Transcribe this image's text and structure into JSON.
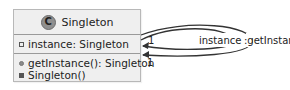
{
  "class": {
    "stereotype_glyph": "C",
    "name": "Singleton",
    "attributes": [
      {
        "visibility": "private",
        "text": "instance: Singleton"
      }
    ],
    "methods": [
      {
        "visibility": "public",
        "text": "getInstance(): Singleton"
      },
      {
        "visibility": "private",
        "text": "Singleton()"
      }
    ]
  },
  "associations": [
    {
      "label": "instance",
      "multiplicity": "1"
    },
    {
      "label": ":getInstance()",
      "multiplicity": "1"
    }
  ],
  "colors": {
    "box_fill": "#efefef",
    "box_border": "#b8b8b8",
    "line": "#333333"
  }
}
